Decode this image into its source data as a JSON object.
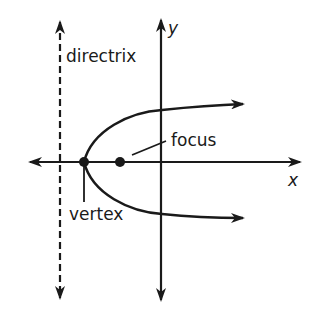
{
  "diagram": {
    "labels": {
      "directrix": "directrix",
      "focus": "focus",
      "vertex": "vertex",
      "x_axis": "x",
      "y_axis": "y"
    },
    "colors": {
      "stroke": "#1a1a1a",
      "background": "#ffffff"
    },
    "points": {
      "vertex": {
        "x": 84,
        "y": 162
      },
      "focus": {
        "x": 120,
        "y": 162
      }
    }
  }
}
